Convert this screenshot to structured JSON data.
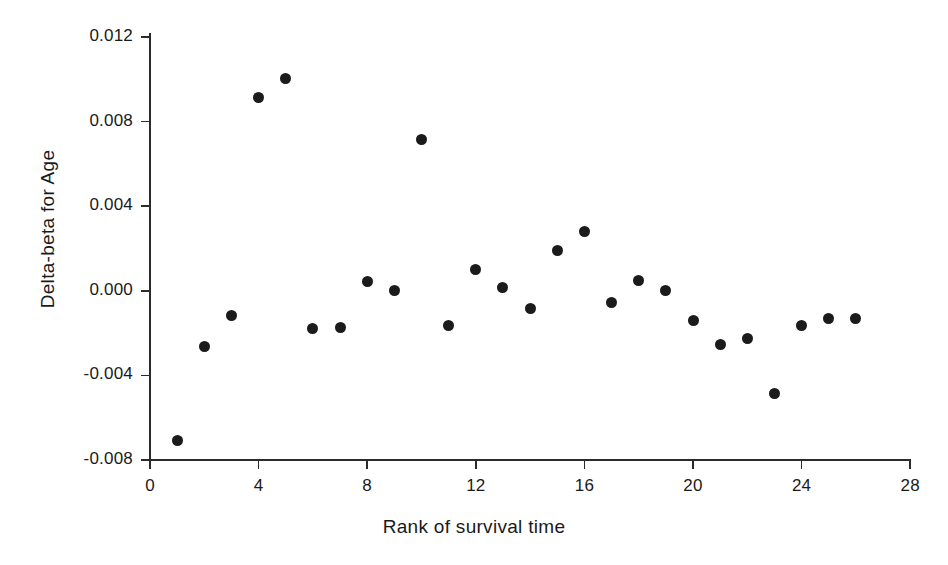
{
  "chart_data": {
    "type": "scatter",
    "title": "",
    "xlabel": "Rank of survival time",
    "ylabel": "Delta-beta for Age",
    "xlim": [
      0,
      28
    ],
    "ylim": [
      -0.008,
      0.012
    ],
    "xticks": [
      0,
      4,
      8,
      12,
      16,
      20,
      24,
      28
    ],
    "xtick_labels": [
      "0",
      "4",
      "8",
      "12",
      "16",
      "20",
      "24",
      "28"
    ],
    "yticks": [
      -0.008,
      -0.004,
      0.0,
      0.004,
      0.008,
      0.012
    ],
    "ytick_labels": [
      "-0.008",
      "-0.004",
      "0.000",
      "0.004",
      "0.008",
      "0.012"
    ],
    "grid": false,
    "legend": false,
    "marker": "filled-circle",
    "marker_color": "#1b1b1b",
    "axis_color": "#2b2b2b",
    "background_color": "#ffffff",
    "x": [
      1,
      2,
      3,
      4,
      5,
      6,
      7,
      8,
      9,
      10,
      11,
      12,
      13,
      14,
      15,
      16,
      17,
      18,
      19,
      20,
      21,
      22,
      23,
      24,
      25,
      26
    ],
    "y": [
      -0.0071,
      -0.00265,
      -0.00115,
      0.00915,
      0.01005,
      -0.0018,
      -0.00175,
      0.00045,
      0.0,
      0.00715,
      -0.00165,
      0.001,
      0.00015,
      -0.00085,
      0.0019,
      0.0028,
      -0.00055,
      0.0005,
      0.0,
      -0.0014,
      -0.00255,
      -0.00225,
      -0.00485,
      -0.00165,
      -0.0013,
      -0.0013
    ],
    "points": [
      {
        "rank": 1,
        "value": -0.0071
      },
      {
        "rank": 2,
        "value": -0.00265
      },
      {
        "rank": 3,
        "value": -0.00115
      },
      {
        "rank": 4,
        "value": 0.00915
      },
      {
        "rank": 5,
        "value": 0.01005
      },
      {
        "rank": 6,
        "value": -0.0018
      },
      {
        "rank": 7,
        "value": -0.00175
      },
      {
        "rank": 8,
        "value": 0.00045
      },
      {
        "rank": 9,
        "value": 0.0
      },
      {
        "rank": 10,
        "value": 0.00715
      },
      {
        "rank": 11,
        "value": -0.00165
      },
      {
        "rank": 12,
        "value": 0.001
      },
      {
        "rank": 13,
        "value": 0.00015
      },
      {
        "rank": 14,
        "value": -0.00085
      },
      {
        "rank": 15,
        "value": 0.0019
      },
      {
        "rank": 16,
        "value": 0.0028
      },
      {
        "rank": 17,
        "value": -0.00055
      },
      {
        "rank": 18,
        "value": 0.0005
      },
      {
        "rank": 19,
        "value": 0.0
      },
      {
        "rank": 20,
        "value": -0.0014
      },
      {
        "rank": 21,
        "value": -0.00255
      },
      {
        "rank": 22,
        "value": -0.00225
      },
      {
        "rank": 23,
        "value": -0.00485
      },
      {
        "rank": 24,
        "value": -0.00165
      },
      {
        "rank": 25,
        "value": -0.0013
      },
      {
        "rank": 26,
        "value": -0.0013
      }
    ]
  }
}
